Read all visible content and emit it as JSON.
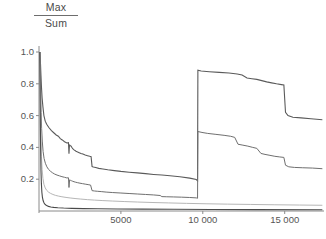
{
  "chart_data": {
    "type": "line",
    "title": "",
    "subtitle": "",
    "ylabel_numerator": "Max",
    "ylabel_denominator": "Sum",
    "xlabel": "",
    "xlim": [
      0,
      17400
    ],
    "ylim": [
      0,
      1.04
    ],
    "grid": false,
    "legend": "none",
    "annotations": [
      "two upper curves are discontinuous at x ≈ 9700, jumping from ~0.18 and ~0.08 up to ~0.87 and ~0.50"
    ],
    "yticks": [
      {
        "value": 1.0,
        "label": "1.0"
      },
      {
        "value": 0.8,
        "label": "0.8"
      },
      {
        "value": 0.6,
        "label": "0.6"
      },
      {
        "value": 0.4,
        "label": "0.4"
      },
      {
        "value": 0.2,
        "label": "0.2"
      }
    ],
    "xticks": [
      {
        "value": 5000,
        "label": "5000"
      },
      {
        "value": 10000,
        "label": "10 000"
      },
      {
        "value": 15000,
        "label": "15 000"
      }
    ],
    "series": [
      {
        "name": "curve-1-upper",
        "color": "#5a5a5a",
        "width": 1.1,
        "points": [
          [
            60,
            1.0
          ],
          [
            90,
            0.93
          ],
          [
            120,
            0.85
          ],
          [
            150,
            0.78
          ],
          [
            190,
            0.71
          ],
          [
            240,
            0.655
          ],
          [
            300,
            0.6
          ],
          [
            380,
            0.565
          ],
          [
            470,
            0.545
          ],
          [
            600,
            0.525
          ],
          [
            760,
            0.505
          ],
          [
            900,
            0.492
          ],
          [
            1050,
            0.478
          ],
          [
            1180,
            0.47
          ],
          [
            1300,
            0.455
          ],
          [
            1420,
            0.447
          ],
          [
            1560,
            0.436
          ],
          [
            1700,
            0.428
          ],
          [
            1800,
            0.43
          ],
          [
            1830,
            0.36
          ],
          [
            1860,
            0.415
          ],
          [
            1900,
            0.412
          ],
          [
            1960,
            0.408
          ],
          [
            2020,
            0.398
          ],
          [
            2060,
            0.392
          ],
          [
            2120,
            0.386
          ],
          [
            2200,
            0.38
          ],
          [
            2260,
            0.376
          ],
          [
            2330,
            0.372
          ],
          [
            2420,
            0.368
          ],
          [
            2560,
            0.362
          ],
          [
            2680,
            0.358
          ],
          [
            2820,
            0.352
          ],
          [
            2960,
            0.348
          ],
          [
            3100,
            0.344
          ],
          [
            3180,
            0.342
          ],
          [
            3240,
            0.28
          ],
          [
            3320,
            0.277
          ],
          [
            3460,
            0.273
          ],
          [
            3650,
            0.268
          ],
          [
            3900,
            0.264
          ],
          [
            4200,
            0.259
          ],
          [
            4600,
            0.254
          ],
          [
            5000,
            0.249
          ],
          [
            5500,
            0.244
          ],
          [
            6000,
            0.24
          ],
          [
            6500,
            0.235
          ],
          [
            7000,
            0.23
          ],
          [
            7500,
            0.226
          ],
          [
            8000,
            0.222
          ],
          [
            8600,
            0.215
          ],
          [
            9200,
            0.207
          ],
          [
            9600,
            0.198
          ],
          [
            9680,
            0.19
          ],
          [
            9700,
            0.885
          ],
          [
            9900,
            0.88
          ],
          [
            10400,
            0.876
          ],
          [
            11000,
            0.872
          ],
          [
            11600,
            0.868
          ],
          [
            12100,
            0.862
          ],
          [
            12400,
            0.855
          ],
          [
            12700,
            0.836
          ],
          [
            13000,
            0.832
          ],
          [
            13300,
            0.828
          ],
          [
            13600,
            0.82
          ],
          [
            13900,
            0.812
          ],
          [
            14200,
            0.806
          ],
          [
            14500,
            0.8
          ],
          [
            14800,
            0.795
          ],
          [
            14950,
            0.792
          ],
          [
            15050,
            0.62
          ],
          [
            15200,
            0.6
          ],
          [
            15500,
            0.59
          ],
          [
            16000,
            0.586
          ],
          [
            16600,
            0.58
          ],
          [
            17300,
            0.574
          ]
        ]
      },
      {
        "name": "curve-2-middle",
        "color": "#6f6f6f",
        "width": 1.0,
        "points": [
          [
            55,
            1.0
          ],
          [
            80,
            0.88
          ],
          [
            105,
            0.74
          ],
          [
            130,
            0.62
          ],
          [
            160,
            0.52
          ],
          [
            200,
            0.44
          ],
          [
            250,
            0.375
          ],
          [
            310,
            0.33
          ],
          [
            390,
            0.3
          ],
          [
            480,
            0.278
          ],
          [
            580,
            0.262
          ],
          [
            700,
            0.25
          ],
          [
            830,
            0.24
          ],
          [
            960,
            0.232
          ],
          [
            1100,
            0.226
          ],
          [
            1250,
            0.221
          ],
          [
            1400,
            0.216
          ],
          [
            1560,
            0.212
          ],
          [
            1700,
            0.208
          ],
          [
            1800,
            0.209
          ],
          [
            1830,
            0.148
          ],
          [
            1870,
            0.196
          ],
          [
            1920,
            0.193
          ],
          [
            1990,
            0.19
          ],
          [
            2060,
            0.187
          ],
          [
            2140,
            0.184
          ],
          [
            2240,
            0.181
          ],
          [
            2360,
            0.178
          ],
          [
            2500,
            0.175
          ],
          [
            2660,
            0.172
          ],
          [
            2820,
            0.169
          ],
          [
            3000,
            0.166
          ],
          [
            3150,
            0.163
          ],
          [
            3240,
            0.128
          ],
          [
            3380,
            0.126
          ],
          [
            3560,
            0.124
          ],
          [
            3800,
            0.122
          ],
          [
            4100,
            0.119
          ],
          [
            4500,
            0.116
          ],
          [
            5000,
            0.113
          ],
          [
            5500,
            0.11
          ],
          [
            6000,
            0.107
          ],
          [
            6500,
            0.104
          ],
          [
            7000,
            0.101
          ],
          [
            7400,
            0.0975
          ],
          [
            7500,
            0.0905
          ],
          [
            7800,
            0.0895
          ],
          [
            8200,
            0.0885
          ],
          [
            8700,
            0.087
          ],
          [
            9200,
            0.085
          ],
          [
            9600,
            0.0825
          ],
          [
            9680,
            0.08
          ],
          [
            9700,
            0.5
          ],
          [
            9950,
            0.494
          ],
          [
            10300,
            0.488
          ],
          [
            10800,
            0.482
          ],
          [
            11300,
            0.476
          ],
          [
            11700,
            0.47
          ],
          [
            11950,
            0.463
          ],
          [
            12150,
            0.42
          ],
          [
            12450,
            0.414
          ],
          [
            12750,
            0.408
          ],
          [
            13050,
            0.4
          ],
          [
            13300,
            0.394
          ],
          [
            13550,
            0.362
          ],
          [
            13800,
            0.356
          ],
          [
            14100,
            0.35
          ],
          [
            14400,
            0.344
          ],
          [
            14700,
            0.34
          ],
          [
            14950,
            0.337
          ],
          [
            15050,
            0.288
          ],
          [
            15250,
            0.278
          ],
          [
            15600,
            0.274
          ],
          [
            16100,
            0.272
          ],
          [
            16700,
            0.27
          ],
          [
            17300,
            0.266
          ]
        ]
      },
      {
        "name": "curve-3-light",
        "color": "#b6b6b6",
        "width": 1.0,
        "points": [
          [
            50,
            1.0
          ],
          [
            72,
            0.82
          ],
          [
            95,
            0.62
          ],
          [
            120,
            0.46
          ],
          [
            150,
            0.345
          ],
          [
            190,
            0.262
          ],
          [
            240,
            0.205
          ],
          [
            300,
            0.168
          ],
          [
            380,
            0.145
          ],
          [
            470,
            0.13
          ],
          [
            580,
            0.119
          ],
          [
            700,
            0.111
          ],
          [
            850,
            0.104
          ],
          [
            1000,
            0.0985
          ],
          [
            1200,
            0.0935
          ],
          [
            1400,
            0.0895
          ],
          [
            1650,
            0.0855
          ],
          [
            1900,
            0.082
          ],
          [
            2200,
            0.0785
          ],
          [
            2550,
            0.075
          ],
          [
            2950,
            0.0715
          ],
          [
            3400,
            0.0685
          ],
          [
            3900,
            0.0655
          ],
          [
            4500,
            0.0625
          ],
          [
            5200,
            0.0595
          ],
          [
            6000,
            0.0565
          ],
          [
            6900,
            0.0535
          ],
          [
            7900,
            0.0508
          ],
          [
            9000,
            0.048
          ],
          [
            10200,
            0.0455
          ],
          [
            11500,
            0.0432
          ],
          [
            12900,
            0.0412
          ],
          [
            14400,
            0.0392
          ],
          [
            15900,
            0.0375
          ],
          [
            17300,
            0.036
          ]
        ]
      },
      {
        "name": "curve-4-dark-baseline",
        "color": "#4a4a4a",
        "width": 1.1,
        "points": [
          [
            48,
            1.0
          ],
          [
            65,
            0.78
          ],
          [
            82,
            0.55
          ],
          [
            100,
            0.38
          ],
          [
            120,
            0.255
          ],
          [
            145,
            0.172
          ],
          [
            175,
            0.118
          ],
          [
            210,
            0.085
          ],
          [
            255,
            0.064
          ],
          [
            310,
            0.05
          ],
          [
            380,
            0.041
          ],
          [
            470,
            0.034
          ],
          [
            580,
            0.029
          ],
          [
            720,
            0.0255
          ],
          [
            900,
            0.0228
          ],
          [
            1150,
            0.0205
          ],
          [
            1500,
            0.0185
          ],
          [
            2000,
            0.0168
          ],
          [
            2700,
            0.0152
          ],
          [
            3600,
            0.014
          ],
          [
            4800,
            0.0128
          ],
          [
            6300,
            0.0118
          ],
          [
            8200,
            0.0108
          ],
          [
            10500,
            0.0098
          ],
          [
            13200,
            0.0088
          ],
          [
            17300,
            0.0078
          ]
        ]
      }
    ]
  },
  "axes": {
    "x_axis_name": "x-axis",
    "y_axis_name": "y-axis"
  }
}
